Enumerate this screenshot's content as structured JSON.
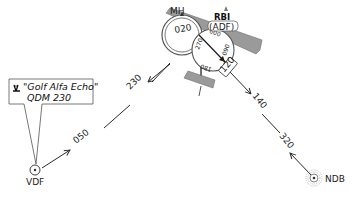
{
  "diagram": {
    "callout": {
      "icon": "radio-tower-icon",
      "callsign": "\"Golf Alfa Echo\"",
      "bearing": "QDM 230"
    },
    "stations": {
      "vdf": "VDF",
      "ndb": "NDB"
    },
    "track_labels": {
      "qdm": "230",
      "qdr": "050",
      "ndb_from": "140",
      "ndb_to": "320"
    },
    "aircraft": {
      "heading_label": "MH",
      "heading_value": "020",
      "rbi_label": "RBI",
      "adf_label": "(ADF)",
      "relative_bearing": "120",
      "dial_marks": [
        "000",
        "090",
        "180",
        "270"
      ]
    },
    "colors": {
      "aircraft": "#9a9a9a",
      "line": "#2a2a2a"
    }
  }
}
